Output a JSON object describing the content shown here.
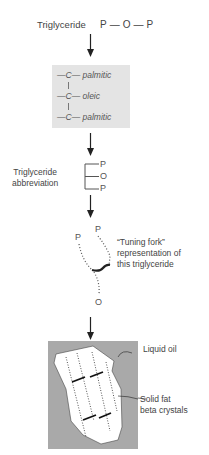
{
  "diagram": {
    "step1": {
      "label": "Triglyceride",
      "formula": "P — O — P"
    },
    "step2": {
      "rows": [
        {
          "atom": "—C—",
          "chain": "palmitic"
        },
        {
          "atom": "—C—",
          "chain": "oleic"
        },
        {
          "atom": "—C—",
          "chain": "palmitic"
        }
      ]
    },
    "step3": {
      "label_line1": "Triglyceride",
      "label_line2": "abbreviation",
      "letters": [
        "P",
        "O",
        "P"
      ]
    },
    "step4": {
      "label_line1": "“Tuning fork”",
      "label_line2": "representation of",
      "label_line3": "this triglyceride",
      "top_left": "P",
      "top_right": "P",
      "bottom": "O"
    },
    "step5": {
      "outer_label": "Liquid oil",
      "inner_label_line1": "Solid fat",
      "inner_label_line2": "beta crystals"
    },
    "colors": {
      "box_gray": "#e4e4e4",
      "oil_gray": "#a9a9a9",
      "line": "#222222",
      "text": "#444444"
    }
  }
}
